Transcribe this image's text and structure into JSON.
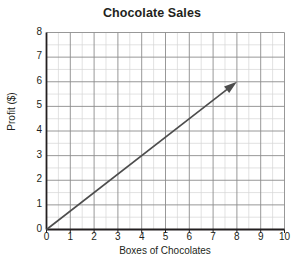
{
  "chart_data": {
    "type": "line",
    "title": "Chocolate Sales",
    "xlabel": "Boxes of Chocolates",
    "ylabel": "Profit ($)",
    "xlim": [
      0,
      10
    ],
    "ylim": [
      0,
      8
    ],
    "xticks": [
      0,
      1,
      2,
      3,
      4,
      5,
      6,
      7,
      8,
      9,
      10
    ],
    "yticks": [
      0,
      1,
      2,
      3,
      4,
      5,
      6,
      7,
      8
    ],
    "grid": true,
    "minor_grid_step": 0.5,
    "legend": null,
    "series": [
      {
        "name": "trend-line",
        "style": "arrow",
        "slope": 0.75,
        "intercept": 0,
        "x": [
          0,
          8
        ],
        "values": [
          0,
          6
        ],
        "color": "#4d4d4d"
      }
    ],
    "colors": {
      "axis": "#231f20",
      "major_grid": "#8c8c8c",
      "minor_grid": "#d6d6d6",
      "line": "#4d4d4d",
      "background": "#ffffff"
    }
  }
}
